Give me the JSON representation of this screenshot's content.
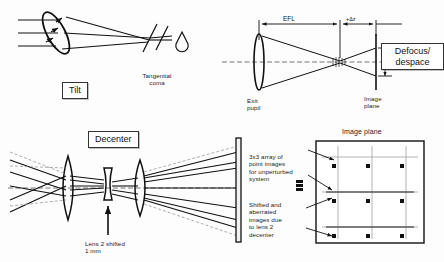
{
  "figure": {
    "background": "#fdfdfd",
    "line_color": "#111111",
    "gray_color": "#8f8f8f"
  },
  "panels": {
    "tilt": {
      "box_label": "Tilt",
      "coma_label": "Tangential\ncoma",
      "ray_count": 3
    },
    "defocus": {
      "box_label": "Defocus/\ndespace",
      "efl_label": "EFL",
      "delta_label": "+Δz",
      "blur_label": "B",
      "exit_pupil_label": "Exit\npupil",
      "image_plane_label": "Image\nplane"
    },
    "decenter": {
      "box_label": "Decenter",
      "shift_note": "Lens 2 shifted\n1 mm",
      "lens_count": 3
    },
    "image_plane": {
      "title": "Image plane",
      "note_unperturbed": "3x3 array of\npoint images\nfor unperturbed\nsystem",
      "note_shifted": "Shifted and\naberrated\nimages due\nto lens 2\ndecenter",
      "grid_rows": 3,
      "grid_cols": 3
    }
  }
}
